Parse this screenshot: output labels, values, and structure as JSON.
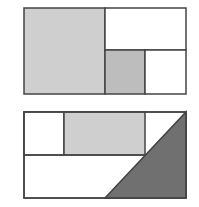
{
  "diagram": {
    "colors": {
      "light_gray": "#cfcfcf",
      "mid_gray": "#bdbdbd",
      "dark_gray": "#6f6f6f",
      "stroke": "#444444",
      "white": "#ffffff"
    },
    "figures": [
      {
        "name": "top-figure",
        "regions": [
          {
            "shape": "square",
            "shade": "light gray"
          },
          {
            "shape": "rectangle",
            "shade": "white"
          },
          {
            "shape": "small square",
            "shade": "gray"
          },
          {
            "shape": "small rectangle",
            "shade": "white"
          }
        ]
      },
      {
        "name": "bottom-figure",
        "regions": [
          {
            "shape": "small rectangle",
            "shade": "white"
          },
          {
            "shape": "rectangle",
            "shade": "light gray"
          },
          {
            "shape": "trapezoid",
            "shade": "white"
          },
          {
            "shape": "right triangle",
            "shade": "dark gray"
          }
        ]
      }
    ]
  }
}
